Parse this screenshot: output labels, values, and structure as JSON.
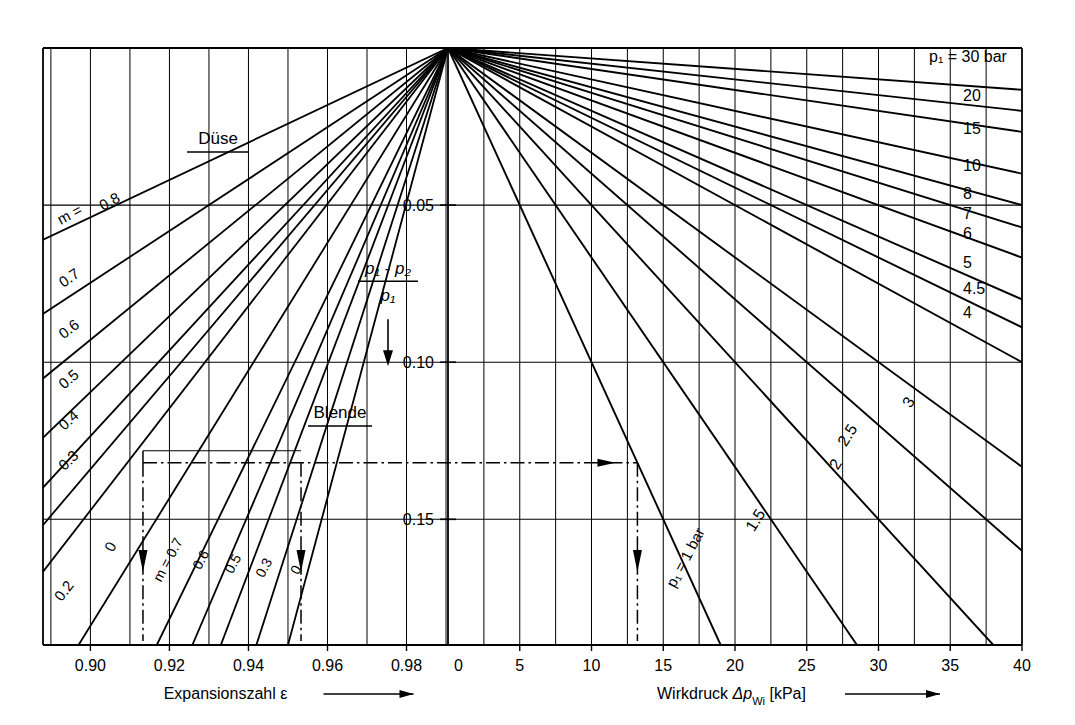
{
  "figure": {
    "kind": "nomogram",
    "language": "de",
    "background": "#ffffff",
    "ink": "#000000"
  },
  "axes": {
    "left": {
      "title": "Expansionszahl",
      "symbol": "ε",
      "arrow": "⟶",
      "ticks": [
        "0.90",
        "0.92",
        "0.94",
        "0.96",
        "0.98"
      ],
      "tick_values": [
        0.9,
        0.92,
        0.94,
        0.96,
        0.98
      ],
      "end_label": "0",
      "range": [
        0.888,
        0.9905
      ]
    },
    "right": {
      "title": "Wirkdruck",
      "symbol": "Δp",
      "symbol_sub": "Wi",
      "unit": "[kPa]",
      "arrow": "⟶",
      "ticks": [
        "0",
        "5",
        "10",
        "15",
        "20",
        "25",
        "30",
        "35",
        "40"
      ],
      "tick_values": [
        0,
        5,
        10,
        15,
        20,
        25,
        30,
        35,
        40
      ],
      "range": [
        0,
        40
      ]
    },
    "vertical": {
      "label_num": "p₁ - p₂",
      "label_den": "p₁",
      "arrow_direction": "down",
      "ticks": [
        "0.05",
        "0.10",
        "0.15"
      ],
      "tick_values": [
        0.05,
        0.1,
        0.15
      ],
      "range": [
        0,
        0.19
      ]
    }
  },
  "panel_left": {
    "groups": [
      {
        "name": "Duese",
        "title": "Düse",
        "underlined": true,
        "prefix_label": "m =",
        "labels": [
          "0.8",
          "0.7",
          "0.6",
          "0.5",
          "0.4",
          "0.3",
          "0.2",
          "0"
        ],
        "values": [
          0.8,
          0.7,
          0.6,
          0.5,
          0.4,
          0.3,
          0.2,
          0.0
        ]
      },
      {
        "name": "Blende",
        "title": "Blende",
        "underlined": true,
        "prefix_label": "m = 0.7",
        "labels": [
          "m = 0.7",
          "0.6",
          "0.5",
          "0.3",
          "0"
        ],
        "values": [
          0.7,
          0.6,
          0.5,
          0.3,
          0.0
        ]
      }
    ]
  },
  "panel_right": {
    "series_header": "p₁ = 30 bar",
    "bottom_label": "p₁ = 1 bar",
    "labels": [
      "30",
      "20",
      "15",
      "10",
      "8",
      "7",
      "6",
      "5",
      "4.5",
      "4",
      "3",
      "2.5",
      "2",
      "1.5",
      "1"
    ],
    "values": [
      30,
      20,
      15,
      10,
      8,
      7,
      6,
      5,
      4.5,
      4,
      3,
      2.5,
      2,
      1.5,
      1
    ]
  },
  "construction": {
    "horizontal_y": 0.132,
    "epsilon_marks": [
      0.9133,
      0.9533
    ],
    "wirkdruck_mark": 13.2,
    "style": "dash-dot"
  },
  "chart_data": {
    "type": "line",
    "xlabel_left": "Expansionszahl ε",
    "xlabel_right": "Wirkdruck Δp_Wi [kPa]",
    "ylabel": "(p1 - p2) / p1",
    "ylim": [
      0,
      0.19
    ],
    "xlim_left": [
      0.888,
      0.9905
    ],
    "xlim_right": [
      0,
      40
    ],
    "grid": true,
    "legend": "inline-line-labels",
    "pivot": {
      "epsilon": 1.0,
      "y": 0.0
    },
    "series_left_duese": [
      {
        "name": "m = 0.8",
        "m": 0.8,
        "eps_at_y_max": 0.8872,
        "y_max": 0.0615
      },
      {
        "name": "0.7",
        "m": 0.7,
        "eps_at_y_max": 0.8872,
        "y_max": 0.0853
      },
      {
        "name": "0.6",
        "m": 0.6,
        "eps_at_y_max": 0.8872,
        "y_max": 0.106
      },
      {
        "name": "0.5",
        "m": 0.5,
        "eps_at_y_max": 0.8872,
        "y_max": 0.125
      },
      {
        "name": "0.4",
        "m": 0.4,
        "eps_at_y_max": 0.8872,
        "y_max": 0.141
      },
      {
        "name": "0.3",
        "m": 0.3,
        "eps_at_y_max": 0.8872,
        "y_max": 0.153
      },
      {
        "name": "0.2",
        "m": 0.2,
        "eps_at_y_max": 0.8872,
        "y_max": 0.168
      },
      {
        "name": "0",
        "m": 0.0,
        "eps_at_y_max": 0.897,
        "y_max": 0.19
      }
    ],
    "series_left_blende": [
      {
        "name": "m = 0.7",
        "m": 0.7,
        "eps_at_y_max": 0.9168,
        "y_max": 0.19
      },
      {
        "name": "0.6",
        "m": 0.6,
        "eps_at_y_max": 0.9258,
        "y_max": 0.19
      },
      {
        "name": "0.5",
        "m": 0.5,
        "eps_at_y_max": 0.933,
        "y_max": 0.19
      },
      {
        "name": "0.3",
        "m": 0.3,
        "eps_at_y_max": 0.942,
        "y_max": 0.19
      },
      {
        "name": "0",
        "m": 0.0,
        "eps_at_y_max": 0.95,
        "y_max": 0.19
      }
    ],
    "series_right": [
      {
        "name": "30",
        "p1": 30,
        "dp_at_y": 40.0,
        "y_at_dp": 0.0133
      },
      {
        "name": "20",
        "p1": 20,
        "dp_at_y": 40.0,
        "y_at_dp": 0.02
      },
      {
        "name": "15",
        "p1": 15,
        "dp_at_y": 40.0,
        "y_at_dp": 0.0267
      },
      {
        "name": "10",
        "p1": 10,
        "dp_at_y": 40.0,
        "y_at_dp": 0.04
      },
      {
        "name": "8",
        "p1": 8,
        "dp_at_y": 40.0,
        "y_at_dp": 0.05
      },
      {
        "name": "7",
        "p1": 7,
        "dp_at_y": 40.0,
        "y_at_dp": 0.0571
      },
      {
        "name": "6",
        "p1": 6,
        "dp_at_y": 40.0,
        "y_at_dp": 0.0667
      },
      {
        "name": "5",
        "p1": 5,
        "dp_at_y": 40.0,
        "y_at_dp": 0.08
      },
      {
        "name": "4.5",
        "p1": 4.5,
        "dp_at_y": 40.0,
        "y_at_dp": 0.0889
      },
      {
        "name": "4",
        "p1": 4,
        "dp_at_y": 40.0,
        "y_at_dp": 0.1
      },
      {
        "name": "3",
        "p1": 3,
        "dp_at_y": 40.0,
        "y_at_dp": 0.1333
      },
      {
        "name": "2.5",
        "p1": 2.5,
        "dp_at_y": 40.0,
        "y_at_dp": 0.16
      },
      {
        "name": "2",
        "p1": 2,
        "dp_at_y": 38.0,
        "y_at_dp": 0.19
      },
      {
        "name": "1.5",
        "p1": 1.5,
        "dp_at_y": 28.5,
        "y_at_dp": 0.19
      },
      {
        "name": "1",
        "p1": 1,
        "dp_at_y": 19.0,
        "y_at_dp": 0.19
      }
    ]
  }
}
